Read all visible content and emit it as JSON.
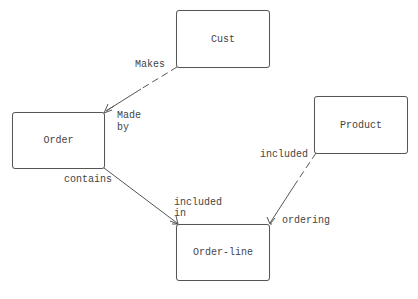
{
  "diagram": {
    "type": "entity-relationship",
    "entities": [
      {
        "id": "cust",
        "label": "Cust"
      },
      {
        "id": "order",
        "label": "Order"
      },
      {
        "id": "product",
        "label": "Product"
      },
      {
        "id": "order_line",
        "label": "Order-line"
      }
    ],
    "relationships": [
      {
        "from": "cust",
        "to": "order",
        "from_label": "Makes",
        "to_label_line1": "Made",
        "to_label_line2": "by",
        "to_cardinality": "many"
      },
      {
        "from": "order",
        "to": "order_line",
        "from_label": "contains",
        "to_label_line1": "included",
        "to_label_line2": "in",
        "to_cardinality": "many"
      },
      {
        "from": "product",
        "to": "order_line",
        "from_label": "included",
        "to_label": "ordering",
        "to_cardinality": "many"
      }
    ]
  },
  "colors": {
    "line": "#555555",
    "text": "#444444",
    "background": "#ffffff"
  }
}
